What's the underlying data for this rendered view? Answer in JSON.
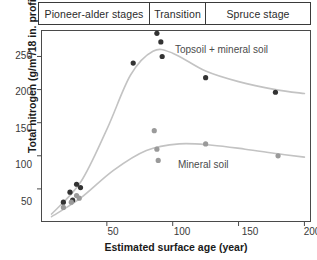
{
  "chart_data": {
    "type": "scatter",
    "title": "",
    "xlabel": "Estimated surface age (year)",
    "ylabel": "Total nitrogen (g/m²/18 in. profile)",
    "xlim": [
      0,
      205
    ],
    "ylim": [
      0,
      290
    ],
    "xticks": [
      50,
      100,
      150,
      200
    ],
    "yticks": [
      50,
      100,
      150,
      200,
      250
    ],
    "grid": false,
    "legend_position": "inline-annotation",
    "stage_bands": [
      {
        "label": "Pioneer-alder stages",
        "x_start": 0,
        "x_end": 80
      },
      {
        "label": "Transition",
        "x_start": 80,
        "x_end": 122
      },
      {
        "label": "Spruce stage",
        "x_start": 122,
        "x_end": 205
      }
    ],
    "series": [
      {
        "name": "Topsoil + mineral soil",
        "color": "#333333",
        "annotation": "Topsoil + mineral soil",
        "points": [
          {
            "x": 17,
            "y": 30
          },
          {
            "x": 22,
            "y": 45
          },
          {
            "x": 24,
            "y": 33
          },
          {
            "x": 27,
            "y": 57
          },
          {
            "x": 30,
            "y": 52
          },
          {
            "x": 70,
            "y": 240
          },
          {
            "x": 88,
            "y": 285
          },
          {
            "x": 91,
            "y": 272
          },
          {
            "x": 92,
            "y": 250
          },
          {
            "x": 125,
            "y": 218
          },
          {
            "x": 178,
            "y": 196
          }
        ],
        "fit_curve": [
          {
            "x": 8,
            "y": 12
          },
          {
            "x": 30,
            "y": 60
          },
          {
            "x": 50,
            "y": 140
          },
          {
            "x": 68,
            "y": 222
          },
          {
            "x": 85,
            "y": 258
          },
          {
            "x": 100,
            "y": 255
          },
          {
            "x": 125,
            "y": 228
          },
          {
            "x": 150,
            "y": 212
          },
          {
            "x": 178,
            "y": 200
          },
          {
            "x": 200,
            "y": 194
          }
        ]
      },
      {
        "name": "Mineral soil",
        "color": "#9a9a9a",
        "annotation": "Mineral soil",
        "points": [
          {
            "x": 17,
            "y": 22
          },
          {
            "x": 23,
            "y": 30
          },
          {
            "x": 27,
            "y": 40
          },
          {
            "x": 29,
            "y": 36
          },
          {
            "x": 86,
            "y": 138
          },
          {
            "x": 88,
            "y": 110
          },
          {
            "x": 89,
            "y": 93
          },
          {
            "x": 125,
            "y": 118
          },
          {
            "x": 180,
            "y": 100
          }
        ],
        "fit_curve": [
          {
            "x": 8,
            "y": 8
          },
          {
            "x": 30,
            "y": 36
          },
          {
            "x": 55,
            "y": 78
          },
          {
            "x": 80,
            "y": 108
          },
          {
            "x": 105,
            "y": 118
          },
          {
            "x": 130,
            "y": 116
          },
          {
            "x": 155,
            "y": 110
          },
          {
            "x": 180,
            "y": 103
          },
          {
            "x": 200,
            "y": 98
          }
        ]
      }
    ]
  }
}
